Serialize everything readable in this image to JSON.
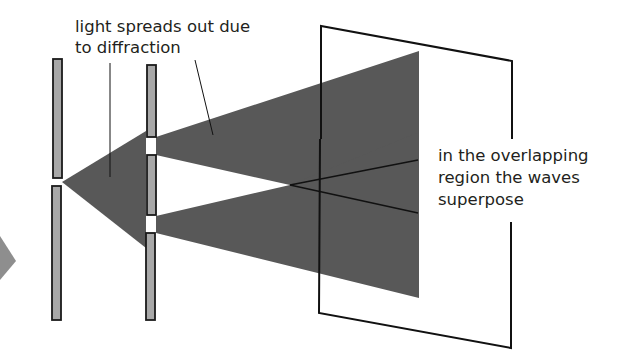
{
  "diagram": {
    "colors": {
      "background": "#ffffff",
      "beam": "#585858",
      "barrier_fill": "#a8a8a8",
      "barrier_stroke": "#1a1a1a",
      "line": "#111111",
      "text": "#231f20",
      "incoming_arrow": "#8e8e8e"
    },
    "labels": {
      "diffraction": {
        "line1": "light spreads out due",
        "line2": "to diffraction"
      },
      "superposition": {
        "line1": "in the overlapping",
        "line2": "region the waves",
        "line3": "superpose"
      }
    },
    "components": {
      "incoming_light": "arrow",
      "single_slit_barrier": "left barrier with one slit",
      "double_slit_barrier": "middle barrier with two slits",
      "screen": "viewing screen"
    }
  }
}
